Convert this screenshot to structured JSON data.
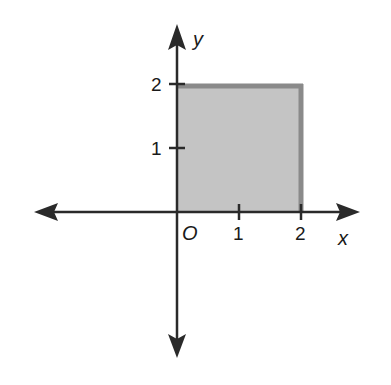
{
  "figure": {
    "type": "coordinate-plane",
    "axes": {
      "x_label": "x",
      "y_label": "y",
      "origin_label": "O",
      "x_ticks": [
        {
          "value": 1,
          "label": "1"
        },
        {
          "value": 2,
          "label": "2"
        }
      ],
      "y_ticks": [
        {
          "value": 1,
          "label": "1"
        },
        {
          "value": 2,
          "label": "2"
        }
      ]
    },
    "region": {
      "shape": "square",
      "vertices": [
        [
          0,
          0
        ],
        [
          2,
          0
        ],
        [
          2,
          2
        ],
        [
          0,
          2
        ]
      ],
      "fill_color": "#c4c4c4",
      "edge_color": "#8a8a8a"
    },
    "colors": {
      "axis": "#2a2a2a",
      "background": "#ffffff"
    }
  }
}
